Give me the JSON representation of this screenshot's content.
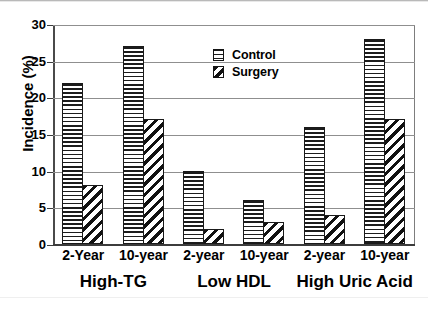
{
  "chart_data": {
    "type": "bar",
    "title": "",
    "subtitle": "",
    "xlabel": "",
    "ylabel": "Incidence (%)",
    "ylim": [
      0,
      30
    ],
    "ytick_values": [
      0,
      5,
      10,
      15,
      20,
      25,
      30
    ],
    "ytick_labels": [
      "0",
      "5",
      "10",
      "15",
      "20",
      "25",
      "30"
    ],
    "grid": "horizontal",
    "legend_position": "inside-top-center",
    "categories": [
      "2-Year",
      "10-year",
      "2-year",
      "10-year",
      "2-year",
      "10-year"
    ],
    "groups": [
      {
        "label": "High-TG",
        "categories": [
          "2-Year",
          "10-year"
        ]
      },
      {
        "label": "Low HDL",
        "categories": [
          "2-year",
          "10-year"
        ]
      },
      {
        "label": "High Uric Acid",
        "categories": [
          "2-year",
          "10-year"
        ]
      }
    ],
    "series": [
      {
        "name": "Control",
        "pattern": "horizontal-lines",
        "values": [
          22,
          27,
          10,
          6,
          16,
          28
        ]
      },
      {
        "name": "Surgery",
        "pattern": "diagonal-hatch",
        "values": [
          8,
          17,
          2,
          3,
          4,
          17
        ]
      }
    ],
    "annotations": []
  },
  "legend": {
    "items": [
      {
        "label": "Control",
        "swatch": "horizontal-lines-swatch"
      },
      {
        "label": "Surgery",
        "swatch": "diagonal-hatch-swatch"
      }
    ]
  },
  "axes": {
    "y_title": "Incidence (%)",
    "y_ticks": [
      "30",
      "25",
      "20",
      "15",
      "10",
      "5",
      "0"
    ]
  },
  "colors": {
    "ink": "#000000",
    "gridline": "#8f8f8f",
    "axis": "#3c3c3c",
    "background": "#ffffff"
  }
}
